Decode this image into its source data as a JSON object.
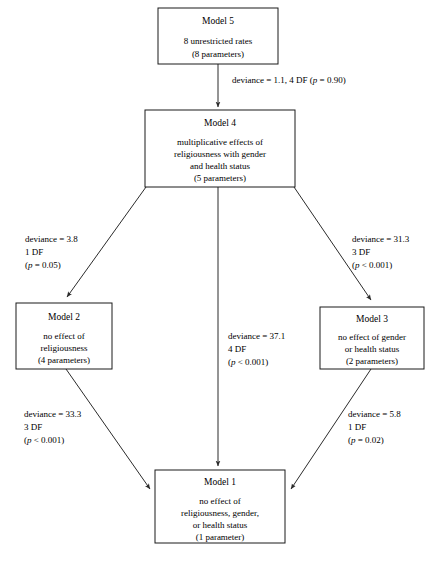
{
  "diagram": {
    "nodes": [
      {
        "id": "model5",
        "title": "Model 5",
        "lines": [
          "8 unrestricted rates",
          "(8 parameters)"
        ]
      },
      {
        "id": "model4",
        "title": "Model 4",
        "lines": [
          "multiplicative effects of",
          "religiousness with gender",
          "and health status",
          "(5 parameters)"
        ]
      },
      {
        "id": "model2",
        "title": "Model 2",
        "lines": [
          "no effect of",
          "religiousness",
          "(4 parameters)"
        ]
      },
      {
        "id": "model3",
        "title": "Model 3",
        "lines": [
          "no effect of gender",
          "or health status",
          "(2 parameters)"
        ]
      },
      {
        "id": "model1",
        "title": "Model 1",
        "lines": [
          "no effect of",
          "religiousness, gender,",
          "or health status",
          "(1 parameter)"
        ]
      }
    ],
    "edges": [
      {
        "id": "edge-5-to-4",
        "from": "model5",
        "to": "model4",
        "label_lines": [
          "deviance = 1.1,  4 DF (p = 0.90)"
        ],
        "deviance": "1.1",
        "df": "4 DF",
        "p": "p = 0.90"
      },
      {
        "id": "edge-4-to-2",
        "from": "model4",
        "to": "model2",
        "label_lines": [
          "deviance = 3.8",
          "1 DF",
          "(p = 0.05)"
        ],
        "deviance": "3.8",
        "df": "1 DF",
        "p": "p = 0.05"
      },
      {
        "id": "edge-4-to-3",
        "from": "model4",
        "to": "model3",
        "label_lines": [
          "deviance = 31.3",
          "3 DF",
          "(p < 0.001)"
        ],
        "deviance": "31.3",
        "df": "3 DF",
        "p": "p < 0.001"
      },
      {
        "id": "edge-4-to-1",
        "from": "model4",
        "to": "model1",
        "label_lines": [
          "deviance = 37.1",
          "4 DF",
          "(p < 0.001)"
        ],
        "deviance": "37.1",
        "df": "4 DF",
        "p": "p < 0.001"
      },
      {
        "id": "edge-2-to-1",
        "from": "model2",
        "to": "model1",
        "label_lines": [
          "deviance = 33.3",
          "3 DF",
          "(p < 0.001)"
        ],
        "deviance": "33.3",
        "df": "3 DF",
        "p": "p < 0.001"
      },
      {
        "id": "edge-3-to-1",
        "from": "model3",
        "to": "model1",
        "label_lines": [
          "deviance = 5.8",
          "1 DF",
          "(p = 0.02)"
        ],
        "deviance": "5.8",
        "df": "1 DF",
        "p": "p = 0.02"
      }
    ],
    "labels": {
      "edge_5_4_prefix": "deviance = 1.1,  4 DF (",
      "edge_5_4_p": "p",
      "edge_5_4_suffix": " = 0.90)",
      "edge_4_2_l1": "deviance = 3.8",
      "edge_4_2_l2": "1 DF",
      "edge_4_2_p": "p",
      "edge_4_2_psuffix": " = 0.05)",
      "edge_4_3_l1": "deviance = 31.3",
      "edge_4_3_l2": "3 DF",
      "edge_4_3_p": "p",
      "edge_4_3_psuffix": " < 0.001)",
      "edge_4_1_l1": "deviance = 37.1",
      "edge_4_1_l2": "4 DF",
      "edge_4_1_p": "p",
      "edge_4_1_psuffix": " < 0.001)",
      "edge_2_1_l1": "deviance = 33.3",
      "edge_2_1_l2": "3 DF",
      "edge_2_1_p": "p",
      "edge_2_1_psuffix": " < 0.001)",
      "edge_3_1_l1": "deviance = 5.8",
      "edge_3_1_l2": "1 DF",
      "edge_3_1_p": "p",
      "edge_3_1_psuffix": " = 0.02)",
      "paren_open": "("
    },
    "colors": {
      "box_stroke": "#1a1a1a",
      "line": "#2b2b2b",
      "text": "#000000",
      "background": "#ffffff"
    }
  }
}
